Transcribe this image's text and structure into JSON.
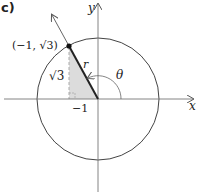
{
  "panel_label": "c)",
  "axes": {
    "x_label": "x",
    "y_label": "y",
    "tick_label": "−1"
  },
  "point": {
    "label": "(−1, √3)",
    "x": -1,
    "y": 1.7320508
  },
  "segment_labels": {
    "radius": "r",
    "height": "√3",
    "angle": "θ"
  },
  "colors": {
    "line": "#333333",
    "axis": "#666666",
    "shade": "#d9d9d9",
    "dashed": "#aaaaaa"
  }
}
